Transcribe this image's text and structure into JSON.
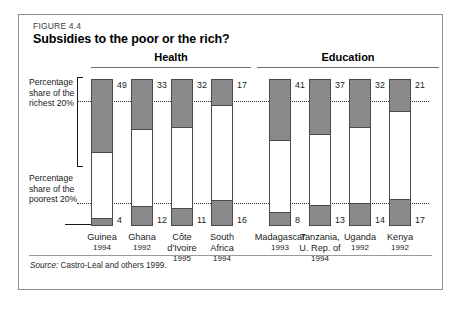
{
  "figure": {
    "number": "FIGURE 4.4",
    "title": "Subsidies to the poor or the rich?",
    "source_prefix": "Source:",
    "source_text": " Castro-Leal and others 1999."
  },
  "annotations": {
    "richest": "Percentage share of the richest 20%",
    "poorest": "Percentage share of the poorest 20%"
  },
  "chart_data": {
    "type": "bar",
    "title": "Subsidies to the poor or the rich?",
    "subtitle": "FIGURE 4.4",
    "xlabel": "",
    "ylabel": "Percentage share",
    "ylim": [
      0,
      100
    ],
    "grid": false,
    "legend_position": "left-annotations",
    "note": "Each bar is a full 100% column; the shaded top segment is the percentage share of the richest 20%, the shaded bottom segment is the percentage share of the poorest 20%.",
    "groups": [
      {
        "name": "Health",
        "categories": [
          "Guinea",
          "Ghana",
          "Côte d'Ivoire",
          "South Africa"
        ],
        "years": [
          "1994",
          "1992",
          "1995",
          "1994"
        ],
        "series": [
          {
            "name": "Percentage share of the richest 20%",
            "values": [
              49,
              33,
              32,
              17
            ]
          },
          {
            "name": "Percentage share of the poorest 20%",
            "values": [
              4,
              12,
              11,
              16
            ]
          }
        ]
      },
      {
        "name": "Education",
        "categories": [
          "Madagascar",
          "Tanzania, U. Rep. of",
          "Uganda",
          "Kenya"
        ],
        "years": [
          "1993",
          "1994",
          "1992",
          "1992"
        ],
        "series": [
          {
            "name": "Percentage share of the richest 20%",
            "values": [
              41,
              37,
              32,
              21
            ]
          },
          {
            "name": "Percentage share of the poorest 20%",
            "values": [
              8,
              13,
              14,
              17
            ]
          }
        ]
      }
    ],
    "reference_lines": [
      {
        "label": "richest reference",
        "value": 33
      },
      {
        "label": "poorest reference",
        "value": 11
      }
    ]
  },
  "bars": [
    {
      "label": "Guinea",
      "year": "1994",
      "rich": "49",
      "poor": "4"
    },
    {
      "label": "Ghana",
      "year": "1992",
      "rich": "33",
      "poor": "12"
    },
    {
      "label": "Côte\nd'Ivoire",
      "year": "1995",
      "rich": "32",
      "poor": "11"
    },
    {
      "label": "South\nAfrica",
      "year": "1994",
      "rich": "17",
      "poor": "16"
    },
    {
      "label": "Madagascar",
      "year": "1993",
      "rich": "41",
      "poor": "8"
    },
    {
      "label": "Tanzania,\nU. Rep. of",
      "year": "1994",
      "rich": "37",
      "poor": "13"
    },
    {
      "label": "Uganda",
      "year": "1992",
      "rich": "32",
      "poor": "14"
    },
    {
      "label": "Kenya",
      "year": "1992",
      "rich": "21",
      "poor": "17"
    }
  ],
  "sections": {
    "health": "Health",
    "education": "Education"
  }
}
